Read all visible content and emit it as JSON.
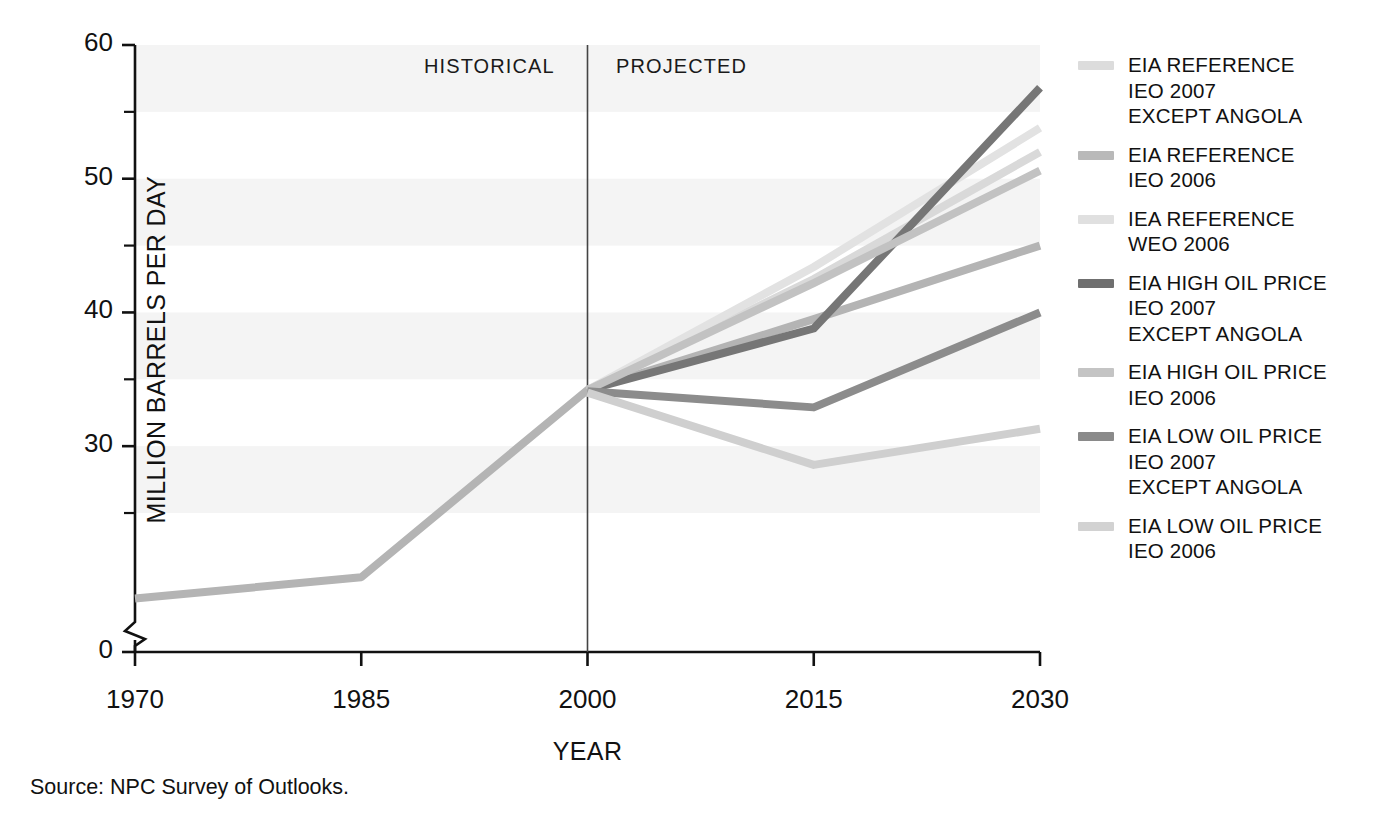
{
  "chart_data": {
    "type": "line",
    "title": "",
    "xlabel": "YEAR",
    "ylabel": "MILLION BARRELS PER DAY",
    "x": [
      1970,
      1985,
      2000,
      2015,
      2030
    ],
    "xlim": [
      1970,
      2030
    ],
    "ylim": [
      0,
      60
    ],
    "y_axis_break": true,
    "y_axis_break_note": "axis broken between 0 and ~17",
    "x_tick_labels": [
      "1970",
      "1985",
      "2000",
      "2015",
      "2030"
    ],
    "y_tick_labels": [
      "0",
      "30",
      "40",
      "50",
      "60"
    ],
    "y_major_ticks": [
      0,
      30,
      40,
      50,
      60
    ],
    "y_minor_ticks": [
      25,
      35,
      45,
      55
    ],
    "grid": false,
    "banded_background": true,
    "legend_position": "right",
    "annotations": [
      {
        "text": "HISTORICAL",
        "x": 1993.5,
        "align": "right-of-divider"
      },
      {
        "text": "PROJECTED",
        "x": 2002.5,
        "align": "left-of-divider"
      }
    ],
    "divider_x": 2000,
    "series": [
      {
        "name": "EIA REFERENCE IEO 2007 EXCEPT ANGOLA",
        "color": "#d9d9d9",
        "x": [
          2000,
          2015,
          2030
        ],
        "values": [
          34.2,
          42.5,
          52.0
        ]
      },
      {
        "name": "EIA REFERENCE IEO 2006",
        "color": "#b4b4b4",
        "x": [
          1970,
          1985,
          2000,
          2015,
          2030
        ],
        "values": [
          18.6,
          20.2,
          34.2,
          39.5,
          45.0
        ]
      },
      {
        "name": "IEA REFERENCE WEO 2006",
        "color": "#e2e2e2",
        "x": [
          2000,
          2015,
          2030
        ],
        "values": [
          34.2,
          43.4,
          53.8
        ]
      },
      {
        "name": "EIA HIGH OIL PRICE IEO 2007 EXCEPT ANGOLA",
        "color": "#767676",
        "x": [
          2000,
          2015,
          2030
        ],
        "values": [
          34.2,
          38.8,
          56.8
        ]
      },
      {
        "name": "EIA HIGH OIL PRICE IEO 2006",
        "color": "#c2c2c2",
        "x": [
          2000,
          2015,
          2030
        ],
        "values": [
          34.2,
          42.2,
          50.6
        ]
      },
      {
        "name": "EIA LOW OIL PRICE IEO 2007 EXCEPT ANGOLA",
        "color": "#8c8c8c",
        "x": [
          2000,
          2015,
          2030
        ],
        "values": [
          34.1,
          32.9,
          40.0
        ]
      },
      {
        "name": "EIA LOW OIL PRICE IEO 2006",
        "color": "#cfcfcf",
        "x": [
          2000,
          2015,
          2030
        ],
        "values": [
          34.0,
          28.6,
          31.3
        ]
      }
    ]
  },
  "axes": {
    "y_title": "MILLION BARRELS PER DAY",
    "x_title": "YEAR",
    "y_ticks": [
      "60",
      "50",
      "40",
      "30",
      "0"
    ],
    "x_ticks": [
      "1970",
      "1985",
      "2000",
      "2015",
      "2030"
    ]
  },
  "period": {
    "historical": "HISTORICAL",
    "projected": "PROJECTED"
  },
  "legend": {
    "items": [
      {
        "color": "#dcdcdc",
        "lines": [
          "EIA REFERENCE",
          "IEO 2007",
          "EXCEPT ANGOLA"
        ]
      },
      {
        "color": "#b9b9b9",
        "lines": [
          "EIA REFERENCE",
          "IEO 2006"
        ]
      },
      {
        "color": "#e0e0e0",
        "lines": [
          "IEA REFERENCE",
          "WEO 2006"
        ]
      },
      {
        "color": "#6f6f6f",
        "lines": [
          "EIA HIGH OIL PRICE",
          "IEO 2007",
          "EXCEPT ANGOLA"
        ]
      },
      {
        "color": "#c4c4c4",
        "lines": [
          "EIA HIGH OIL PRICE",
          "IEO 2006"
        ]
      },
      {
        "color": "#8a8a8a",
        "lines": [
          "EIA LOW OIL PRICE",
          "IEO 2007",
          "EXCEPT ANGOLA"
        ]
      },
      {
        "color": "#d2d2d2",
        "lines": [
          "EIA LOW OIL PRICE",
          "IEO 2006"
        ]
      }
    ]
  },
  "source": {
    "text": "Source:  NPC Survey of Outlooks."
  }
}
